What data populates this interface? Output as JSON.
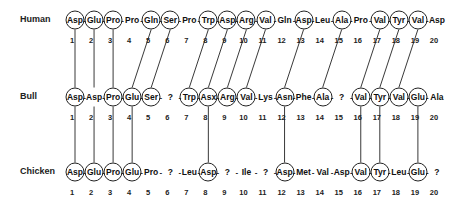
{
  "diagram": {
    "rows": [
      {
        "species": "Human",
        "residues": [
          "Asp",
          "Glu",
          "Pro",
          "Pro",
          "Gln",
          "Ser",
          "Pro",
          "Trp",
          "Asp",
          "Arg",
          "Val",
          "Gln",
          "Asp",
          "Leu",
          "Ala",
          "Pro",
          "Val",
          "Tyr",
          "Val",
          "Asp"
        ],
        "circled": [
          1,
          2,
          3,
          5,
          6,
          8,
          9,
          10,
          11,
          13,
          15,
          17,
          18,
          19
        ]
      },
      {
        "species": "Bull",
        "residues": [
          "Asp",
          "Asp",
          "Pro",
          "Glu",
          "Ser",
          "?",
          "Trp",
          "Asx",
          "Arg",
          "Val",
          "Lys",
          "Asn",
          "Phe",
          "Ala",
          "?",
          "Val",
          "Tyr",
          "Val",
          "Glu",
          "Ala"
        ],
        "circled": [
          1,
          3,
          4,
          5,
          7,
          8,
          9,
          10,
          12,
          14,
          16,
          17,
          18,
          19
        ]
      },
      {
        "species": "Chicken",
        "residues": [
          "Asp",
          "Glu",
          "Pro",
          "Glu",
          "Pro",
          "?",
          "Leu",
          "Asp",
          "?",
          "Ile",
          "?",
          "Asp",
          "Met",
          "Val",
          "Asp",
          "Val",
          "Tyr",
          "Leu",
          "Glu",
          "?"
        ],
        "circled": [
          1,
          2,
          3,
          4,
          8,
          12,
          16,
          17,
          19
        ]
      }
    ],
    "positions": [
      "1",
      "2",
      "3",
      "4",
      "5",
      "6",
      "7",
      "8",
      "9",
      "10",
      "11",
      "12",
      "13",
      "14",
      "15",
      "16",
      "17",
      "18",
      "19",
      "20"
    ],
    "connections_human_bull": [
      [
        1,
        1
      ],
      [
        2,
        2
      ],
      [
        3,
        3
      ],
      [
        5,
        4
      ],
      [
        6,
        5
      ],
      [
        8,
        7
      ],
      [
        9,
        8
      ],
      [
        10,
        9
      ],
      [
        11,
        10
      ],
      [
        13,
        12
      ],
      [
        15,
        14
      ],
      [
        17,
        16
      ],
      [
        18,
        17
      ],
      [
        19,
        18
      ]
    ],
    "connections_bull_chicken": [
      [
        1,
        1
      ],
      [
        2,
        2
      ],
      [
        3,
        3
      ],
      [
        4,
        4
      ],
      [
        8,
        8
      ],
      [
        12,
        12
      ],
      [
        16,
        16
      ],
      [
        17,
        17
      ],
      [
        19,
        19
      ]
    ],
    "line_color": "#222222"
  }
}
